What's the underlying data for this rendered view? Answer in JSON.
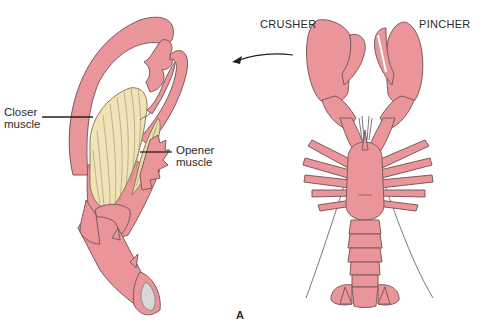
{
  "figure": {
    "panel_label": "A",
    "labels": {
      "crusher": "CRUSHER",
      "pincher": "PINCHER",
      "closer_muscle_line1": "Closer",
      "closer_muscle_line2": "muscle",
      "opener_muscle_line1": "Opener",
      "opener_muscle_line2": "muscle"
    },
    "colors": {
      "shell": "#e9959a",
      "shell_outline": "#7d5a5c",
      "muscle": "#f1e3b8",
      "muscle_lines": "#9c8a5c",
      "leader_line": "#222222"
    },
    "subjects": [
      "cutaway-crusher-claw",
      "whole-lobster-dorsal-view"
    ]
  }
}
